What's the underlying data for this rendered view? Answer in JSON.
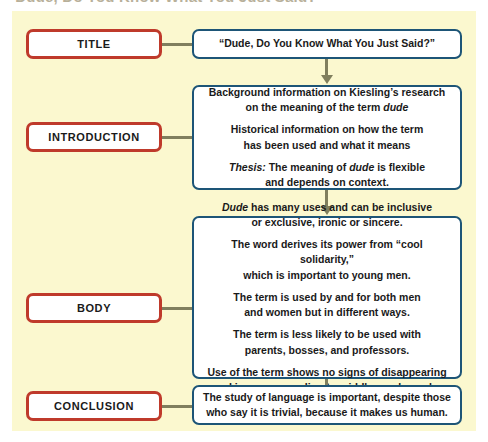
{
  "page": {
    "cropped_heading": "\"Dude, Do You Know What You Just Said?\"",
    "canvas_color": "#fbf8cf",
    "label_border_color": "#bf3a2b",
    "content_border_color": "#1d5577",
    "connector_color": "#807f5e"
  },
  "sections": [
    {
      "label": "TITLE",
      "lines": [
        [
          "“Dude, Do You Know What You Just Said?”"
        ]
      ]
    },
    {
      "label": "INTRODUCTION",
      "lines": [
        [
          "Background information on Kiesling’s research",
          "on the meaning of the term dude"
        ],
        [
          "Historical information on how the term",
          "has been used and what it means"
        ],
        [
          "Thesis: The meaning of dude is flexible",
          "and depends on context."
        ]
      ]
    },
    {
      "label": "BODY",
      "lines": [
        [
          "Dude has many uses and can be inclusive",
          "or exclusive, ironic or sincere."
        ],
        [
          "The word derives its power from “cool solidarity,”",
          "which is important to young men."
        ],
        [
          "The term is used by and for both men",
          "and women but in different ways."
        ],
        [
          "The term is less likely to be used with",
          "parents, bosses, and professors."
        ],
        [
          "Use of the term shows no signs of disappearing",
          "and is even spreading to middle-aged people."
        ]
      ]
    },
    {
      "label": "CONCLUSION",
      "lines": [
        [
          "The study of language is important, despite those",
          "who say it is trivial, because it makes us human."
        ]
      ]
    }
  ]
}
